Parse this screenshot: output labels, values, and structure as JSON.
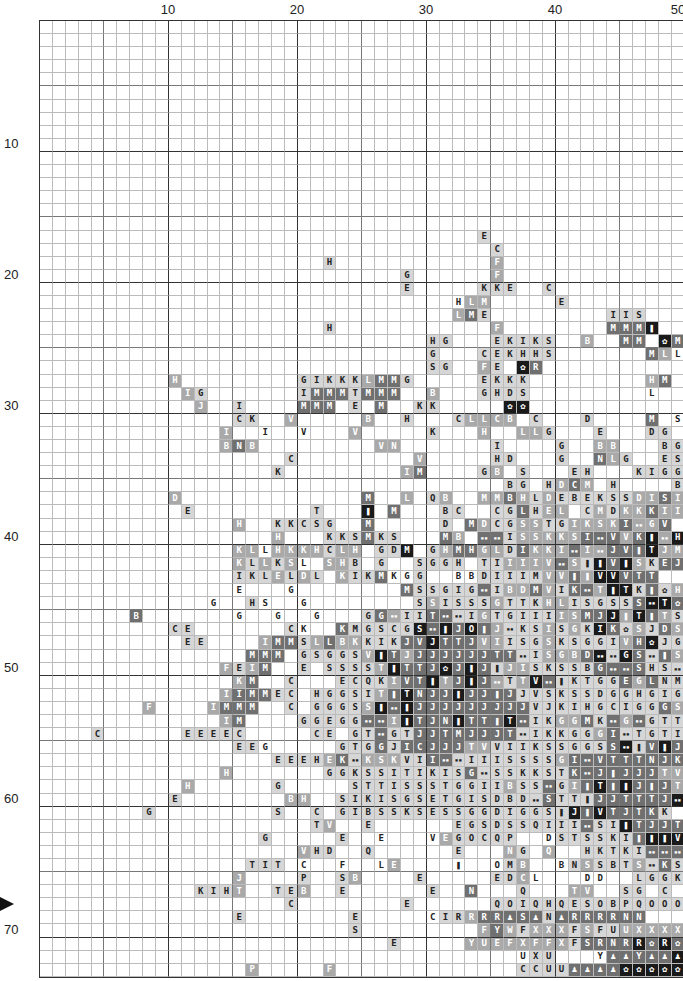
{
  "chart": {
    "title": "",
    "columns": 50,
    "rows": 73,
    "col_labels": [
      {
        "value": "10",
        "col": 10
      },
      {
        "value": "20",
        "col": 20
      },
      {
        "value": "30",
        "col": 30
      },
      {
        "value": "40",
        "col": 40
      },
      {
        "value": "50",
        "col": 50
      }
    ],
    "row_labels": [
      {
        "value": "10",
        "row": 10
      },
      {
        "value": "20",
        "row": 20
      },
      {
        "value": "30",
        "row": 30
      },
      {
        "value": "40",
        "row": 40
      },
      {
        "value": "50",
        "row": 50
      },
      {
        "value": "60",
        "row": 60
      },
      {
        "value": "70",
        "row": 70
      }
    ],
    "center_marker_row": 68,
    "symbol_legend": {
      "#": "double-block-icon",
      "!": "bottle-icon",
      "@": "claw-icon",
      "&": "alien-icon",
      ".": "empty"
    },
    "shade_colors": {
      "0": "#ffffff",
      "1": "#d6d6d6",
      "2": "#a9a9a9",
      "3": "#707070",
      "4": "#1a1a1a"
    },
    "grid_rows": [
      {
        "s": "..................................................",
        "h": "00000000000000000000000000000000000000000000000000"
      },
      {
        "s": "..................................................",
        "h": "00000000000000000000000000000000000000000000000000"
      },
      {
        "s": "..................................................",
        "h": "00000000000000000000000000000000000000000000000000"
      },
      {
        "s": "..................................................",
        "h": "00000000000000000000000000000000000000000000000000"
      },
      {
        "s": "..................................................",
        "h": "00000000000000000000000000000000000000000000000000"
      },
      {
        "s": "..................................................",
        "h": "00000000000000000000000000000000000000000000000000"
      },
      {
        "s": "..................................................",
        "h": "00000000000000000000000000000000000000000000000000"
      },
      {
        "s": "..................................................",
        "h": "00000000000000000000000000000000000000000000000000"
      },
      {
        "s": "..................................................",
        "h": "00000000000000000000000000000000000000000000000000"
      },
      {
        "s": "..................................................",
        "h": "00000000000000000000000000000000000000000000000000"
      },
      {
        "s": "..................................................",
        "h": "00000000000000000000000000000000000000000000000000"
      },
      {
        "s": "..................................................",
        "h": "00000000000000000000000000000000000000000000000000"
      },
      {
        "s": "..................................................",
        "h": "00000000000000000000000000000000000000000000000000"
      },
      {
        "s": "..................................................",
        "h": "00000000000000000000000000000000000000000000000000"
      },
      {
        "s": "..................................................",
        "h": "00000000000000000000000000000000000000000000000000"
      },
      {
        "s": "..................................................",
        "h": "00000000000000000000000000000000000000000000000000"
      },
      {
        "s": "..................................E...............",
        "h": "00000000000000000000000000000000001000000000000000"
      },
      {
        "s": "...................................C..............",
        "h": "00000000000000000000000000000000000100000000000000"
      },
      {
        "s": "......................H............F..............",
        "h": "00000000000000000000001000000000000200000000000000"
      },
      {
        "s": "............................G......F..............",
        "h": "00000000000000000000000000001000000200000000000000"
      },
      {
        "s": "............................E.....KKE..C..........",
        "h": "00000000000000000000000000001000001110010000000000"
      },
      {
        "s": "................................HLM.....E.........",
        "h": "00000000000000000000000000000000022200001000000000"
      },
      {
        "s": "................................LME.........IIS...",
        "h": "00000000000000000000000000000000231000000000111000"
      },
      {
        "s": "......................H............F........MMM!..",
        "h": "00000000000000000000001000000000000200000000333400"
      },
      {
        "s": "..............................HG...EKIKS..B..MM.@M",
        "h": "00000000000000000000000000000011000111110020033043"
      },
      {
        "s": "..............................G...CEKHHS.......MLL",
        "h": "00000000000000000000000000000010001111110000000320"
      },
      {
        "s": "..............................SG..FE.@R...........E",
        "h": "00000000000000000000000000000011002104300000000001"
      },
      {
        "s": "..........H.........GIKKKLMMG.....EKKK.........HM.",
        "h": "00000000002000000000111112331000001111000000000233"
      },
      {
        "s": "...........IG.......IMMMTMMM..B...GHDS.........L..",
        "h": "00000000000210000000133313330020001111000000000020"
      },
      {
        "s": "............J..I....MMM.E.M..KK.....@@............",
        "h": "00000000000020010000333010300110000044000000000000"
      },
      {
        "s": "...............CK..V.....B..H...CLLCB.C...D....M.SS",
        "h": "00000000000000011002000002001000122220100010000300"
      },
      {
        "s": "..............I..I..V...V.....K...H..LLG...E...DG.SKS@G",
        "h": "00000000000000202002000020000010002002210001000110"
      },
      {
        "s": "..............BNB.........VN.......I....G..BB...BG..",
        "h": "00000000000000232000000000220000000100001002200011"
      },
      {
        "s": "...................C.........V.....HD...G..NLG..ES.SKGG",
        "h": "00000000000000000001000000000200000110001003210011"
      },
      {
        "s": "..................K.........IM....GB.S...EH...KIGG.SKGG",
        "h": "00000000000000000010000000002300001201000112001111"
      },
      {
        "s": "....................................BG.HDCM.H....BSKSKSKKS",
        "h": "00000000000000000000000000000000000011012320100111"
      },
      {
        "s": "..........D..............M..L.QB..MMBHLDEBEKSSDISIV#G",
        "h": "00000000002000000000000003002012002232121111112232"
      },
      {
        "s": "...........E.........T...!.M...BC..CGLHEL.CMDKKKII#IV",
        "h": "00000000000100000000010004030001100113122312122322"
      },
      {
        "s": "...............H..KKCSG..M.....D.MDCGSSTGIKSKI#GV",
        "h": "00000000000000020011111003000001032112211222232232"
      },
      {
        "s": "..................H...KKSMKS...MB.##ISSKKSI#VVK!#H",
        "h": "00000000000000000020001113110003203312222233323424"
      },
      {
        "s": "...............KLLHKKHCLH.GDM.GHMHGLDIKKI#I#JV!TJMS",
        "h": "00000000000000222022221220114012332213222322333422"
      },
      {
        "s": "...............KLLKSL.SHB.G..SGGH.TIIIIV#S!!V!SKEJ",
        "h": "00000000000000221212012210100111101122223214342133"
      },
      {
        "s": "...............IKLELDL.KIKMKGG..BBDIIIMVV!!VVVTT",
        "h": "00000000000000211121210211300111001111122324433322"
      },
      {
        "s": "...............E...G........MSSGIG#IBDMVIK#T!TK!@HVV",
        "h": "00000000000000100010000000003111113122321332441312"
      },
      {
        "s": ".............G..HS..G........SSISSSGTTKHLISGSSS#T@JMVV!@V",
        "h": "00000000000010011001000000001121111211122111113443"
      },
      {
        "s": ".......B.......G..G..G...GG#IIT##IGTGIIIISMJJ!T!TS",
        "h": "00000003000000100100100011321133112111112233424321"
      },
      {
        "s": "..........CE.......CK..KMGSCGS#!JO!J#KSISGKIK@SJDSSVG!",
        "h": "00000000001100000011001311111434343211121214312132"
      },
      {
        "s": "...........EE....IMMSLLBKKIKJVJTTJVIISGSKSGGIVH@JGG",
        "h": "00000000000110000233123221113343332211121111123411"
      },
      {
        "s": "................MMM.GSGGSV!TJJJJJJJTT#ISGBD##GS#!SGJI",
        "h": "00000000000000003330111112432333333331122234143132"
      },
      {
        "s": "..............FEIM..E.SSSST!TTJ@J!J!JISKSSBG##SHS#GG",
        "h": "00000000000000212300101111243334343122111113333111"
      },
      {
        "s": "...............KM..C...ECQKIVT!TJ!J#TTV#!KTGGEGLNMIGKG",
        "h": "00000000000000023001000111123342343212431111132311"
      },
      {
        "s": "..............IIMMEC.HGGSIT!TNJJ!JJ!JJVSKSSDGGHGIGGKG",
        "h": "00000000000000233311011111234333433331111111111111"
      },
      {
        "s": "........F....IMMM..C.GGGSS!#!JJJJJJJJJVJKIHGCIGGGSSNL",
        "h": "00000000200002333001011112434333333333111111111132"
      },
      {
        "s": "..............IM....GGEGG##I!TJN!TT!T#IKGGMK#G#GTTG@B",
        "h": "00000000000000230000111113324333433343112231323111341"
      },
      {
        "s": "....C......EEEEC.....CE.GT#GTJJTMJJJT#IKKGGGI#TGTISSSL",
        "h": "00001000000111110000011011311333333331111112311111112"
      },
      {
        "s": "...............EEG.....GTGGJICJJJTVVIIKSSGGSS#!V!J#GG",
        "h": "00000000000000111000001111313333322111111111341343111"
      },
      {
        "s": "..................EEEHEK#KSKVII##IIISSSSGI#VTTTNJK#",
        "h": "00000000000000000111112312221133111111112333333333"
      },
      {
        "s": "..............H.......GGKSSITIKISG#SSKKSTK#J!JJJTVI",
        "h": "00000000000000200000001111111111131111111333333322"
      },
      {
        "s": "...........H......G.....STTISSSTGGIIBSS#GI!T!!J!JTI",
        "h": "00000000000200000010000011111111111121131234343332"
      },
      {
        "s": "..........E........BH..SIKISGSETGISDBD#STT!JJTTTJ#",
        "h": "00000000001000000002200111111111111111131113333334"
      },
      {
        "s": "........G.........S..C.GIBSSKSESSGGDIGGS!J!VTJTKK",
        "h": "00000000100000000010010111111111111111111434333311"
      },
      {
        "s": ".....................TV..E......EGSDSSQIII#SI!TJJTJIS",
        "h": "00000000000000000000012001000000111111111131143333111"
      },
      {
        "s": ".................G.....E..E...VEGOCQP..DSTSSKI!!!V#IE",
        "h": "00000000000000000100000100010002111111001111113444321"
      },
      {
        "s": "....................VHD..Q......E...NG.Q..HKTKI###IKGI",
        "h": "00000000000000000000211001000000100221020011111333111"
      },
      {
        "s": "................TIT.C..F..LE....!..OMB..BNSSBTS#KSGSKQ",
        "h": "00000000000000001110010010022000040012100121112131111"
      },
      {
        "s": "...............J....P..SB....E.....EDCL...DD..LGGKSGKG..SG",
        "h": "00000000000000020000100120000100001112001100211111100"
      },
      {
        "s": "............KIHT..TEB..E......E..N...Q...TV..SG.C.S....BM",
        "h": "00000000000011120011200100000010030001000220011010100023"
      },
      {
        "s": "...................C........E......QOIQHQESOBPQOOOQH",
        "h": "00000000000000000001000000001000000111111111111111111"
      },
      {
        "s": "...............E........E.....CIRRRR&S&N&RRRRNN",
        "h": "00000000000000010000000010000001123333313333333333"
      },
      {
        "s": "........................S.........FYWFXXXFSFUUXXXXFF",
        "h": "00000000000000000000000010000000002321222121122222"
      },
      {
        "s": "...........................E.....YUEFXFFXFSRNRR@R@&R",
        "h": "00000000000000000000000000010000022222222133334343"
      },
      {
        "s": ".....................................UXU...Y&&Y&&&@@@",
        "h": "00000000000000000000000000000000000000111000333334444"
      },
      {
        "s": "................P.....F..............CCUU&&&&@@@@@@@@",
        "h": "00000000000000002000002000000000000001111333344444444"
      }
    ]
  }
}
